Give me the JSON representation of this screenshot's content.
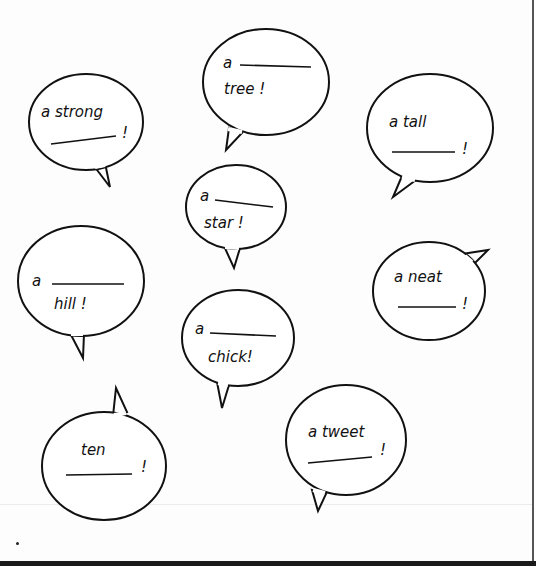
{
  "worksheet": {
    "bubbles": [
      {
        "id": "tree",
        "line1": "a",
        "line2": "tree !",
        "layout": "prefix-blank-word"
      },
      {
        "id": "strong",
        "line1": "a strong",
        "line2": "!",
        "layout": "phrase-blank"
      },
      {
        "id": "tall",
        "line1": "a tall",
        "line2": "!",
        "layout": "phrase-blank"
      },
      {
        "id": "star",
        "line1": "a",
        "line2": "star !",
        "layout": "prefix-blank-word"
      },
      {
        "id": "hill",
        "line1": "a",
        "line2": "hill !",
        "layout": "prefix-blank-word"
      },
      {
        "id": "neat",
        "line1": "a neat",
        "line2": "!",
        "layout": "phrase-blank"
      },
      {
        "id": "chick",
        "line1": "a",
        "line2": "chick!",
        "layout": "prefix-blank-word"
      },
      {
        "id": "ten",
        "line1": "ten",
        "line2": "!",
        "layout": "phrase-blank"
      },
      {
        "id": "tweet",
        "line1": "a tweet",
        "line2": "!",
        "layout": "phrase-blank"
      }
    ],
    "colors": {
      "ink": "#111111",
      "paper": "#fdfdfd",
      "border": "#1a1a1a"
    }
  }
}
